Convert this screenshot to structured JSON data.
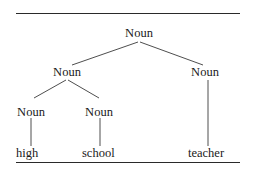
{
  "diagram": {
    "type": "syntax-tree",
    "colors": {
      "text": "#1a1a1a",
      "line": "#3a3a3a",
      "background": "#ffffff"
    },
    "nodes": {
      "root": {
        "label": "Noun"
      },
      "left": {
        "label": "Noun"
      },
      "right": {
        "label": "Noun"
      },
      "left_left": {
        "label": "Noun"
      },
      "left_right": {
        "label": "Noun"
      }
    },
    "leaves": {
      "high": "high",
      "school": "school",
      "teacher": "teacher"
    },
    "edges": [
      [
        "root",
        "left"
      ],
      [
        "root",
        "right"
      ],
      [
        "left",
        "left_left"
      ],
      [
        "left",
        "left_right"
      ],
      [
        "left_left",
        "high"
      ],
      [
        "left_right",
        "school"
      ],
      [
        "right",
        "teacher"
      ]
    ]
  }
}
